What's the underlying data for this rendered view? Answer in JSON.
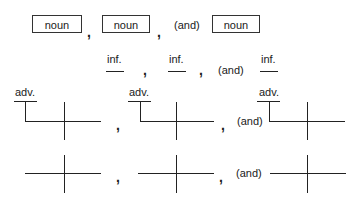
{
  "rows": {
    "nouns": {
      "items": [
        "noun",
        "noun",
        "noun"
      ],
      "separators": [
        ",",
        ","
      ],
      "conjunction": "(and)"
    },
    "infinitives": {
      "items": [
        "inf.",
        "inf.",
        "inf."
      ],
      "separators": [
        ",",
        ","
      ],
      "conjunction": "(and)"
    },
    "adverb_diagrams": {
      "modifier_labels": [
        "adv.",
        "adv.",
        "adv."
      ],
      "separators": [
        ",",
        ","
      ],
      "conjunction": "(and)"
    },
    "plain_diagrams": {
      "separators": [
        ",",
        ","
      ],
      "conjunction": "(and)"
    }
  }
}
